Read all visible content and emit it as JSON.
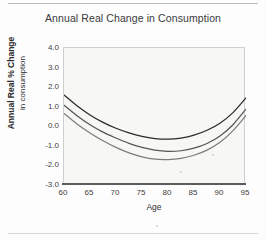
{
  "chart_data": {
    "type": "line",
    "title": "Annual Real Change in Consumption",
    "xlabel": "Age",
    "ylabel_line1": "Annual Real % Change",
    "ylabel_line2": "in consumption",
    "xlim": [
      60,
      95
    ],
    "ylim": [
      -3.0,
      4.0
    ],
    "xticks": [
      60,
      65,
      70,
      75,
      80,
      85,
      90,
      95
    ],
    "xtick_labels": [
      "60",
      "65",
      "70",
      "75",
      "80",
      "85",
      "90",
      "95"
    ],
    "yticks": [
      4.0,
      3.0,
      2.0,
      1.0,
      0.0,
      -1.0,
      -2.0,
      -3.0
    ],
    "ytick_labels": [
      "4.0",
      "3.0",
      "2.0",
      "1.0",
      "0.0",
      "-1.0",
      "-2.0",
      "-3.0"
    ],
    "grid": false,
    "legend": "none",
    "x": [
      60,
      62.5,
      65,
      67.5,
      70,
      72.5,
      75,
      77.5,
      80,
      82.5,
      85,
      87.5,
      90,
      92.5,
      95
    ],
    "series": [
      {
        "name": "upper",
        "color": "#2b2b2b",
        "values": [
          1.6,
          1.05,
          0.58,
          0.2,
          -0.1,
          -0.34,
          -0.52,
          -0.63,
          -0.66,
          -0.6,
          -0.45,
          -0.2,
          0.16,
          0.7,
          1.45
        ]
      },
      {
        "name": "middle",
        "color": "#555555",
        "values": [
          1.08,
          0.54,
          0.08,
          -0.3,
          -0.6,
          -0.87,
          -1.08,
          -1.22,
          -1.28,
          -1.25,
          -1.12,
          -0.88,
          -0.5,
          0.08,
          0.88
        ]
      },
      {
        "name": "lower",
        "color": "#7d7d7d",
        "values": [
          0.66,
          0.12,
          -0.34,
          -0.74,
          -1.08,
          -1.36,
          -1.56,
          -1.68,
          -1.7,
          -1.64,
          -1.48,
          -1.22,
          -0.82,
          -0.22,
          0.55
        ]
      }
    ]
  },
  "figure": {
    "plot_background": "#f7f7f5",
    "axis_color": "#5c5c5c",
    "text_color": "#3d3d3d"
  }
}
